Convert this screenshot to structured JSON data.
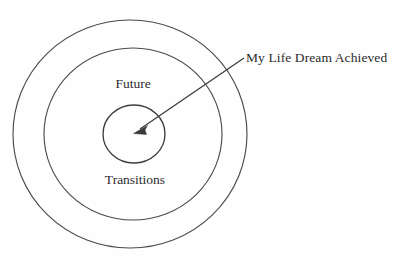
{
  "diagram": {
    "type": "concentric-circles",
    "title": "",
    "background_color": "#fefefe",
    "stroke_color": "#4b4b4b",
    "text_color": "#2c2c2c",
    "center": {
      "x": 130,
      "y": 134
    },
    "rings": [
      {
        "name": "outer-ring",
        "label": "",
        "radius_x": 117,
        "radius_y": 114
      },
      {
        "name": "middle-ring",
        "label": "",
        "radius_x": 89,
        "radius_y": 86
      },
      {
        "name": "inner-circle",
        "label": "",
        "radius_x": 31,
        "radius_y": 29
      }
    ],
    "labels": {
      "future": "Future",
      "transitions": "Transitions",
      "callout": "My Life Dream Achieved"
    },
    "callout_arrow": {
      "name": "callout-arrow",
      "from": {
        "x": 244,
        "y": 58
      },
      "to": {
        "x": 134,
        "y": 133
      },
      "points_to": "inner-circle"
    }
  }
}
